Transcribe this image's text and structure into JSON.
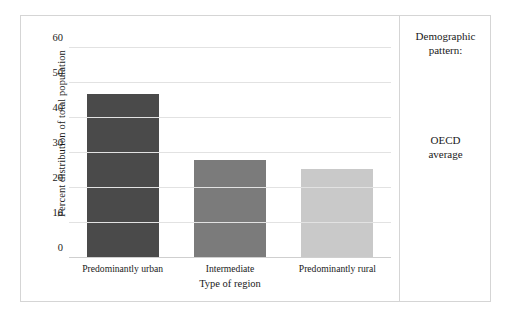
{
  "chart_data": {
    "type": "bar",
    "title": "",
    "subtitle": "",
    "categories": [
      "Predominantly urban",
      "Intermediate",
      "Predominantly rural"
    ],
    "values": [
      47,
      28,
      25.5
    ],
    "series": [
      {
        "name": "OECD average",
        "values": [
          47,
          28,
          25.5
        ],
        "colors": [
          "#4a4a4a",
          "#7b7b7b",
          "#c9c9c9"
        ]
      }
    ],
    "xlabel": "Type of region",
    "ylabel": "Percent distribution of total population",
    "ylim": [
      0,
      60
    ],
    "yticks": [
      0,
      10,
      20,
      30,
      40,
      50,
      60
    ],
    "ytick_labels": [
      "0",
      "10",
      "20",
      "30",
      "40",
      "50",
      "60"
    ],
    "grid": true,
    "grid_axis": "y",
    "legend_position": "right",
    "legend_title": "Demographic pattern:",
    "legend_entries": [
      "OECD average"
    ]
  },
  "legend": {
    "title_line1": "Demographic",
    "title_line2": "pattern:",
    "entry_line1": "OECD",
    "entry_line2": "average"
  },
  "colors": {
    "bar_urban": "#4a4a4a",
    "bar_intermediate": "#7b7b7b",
    "bar_rural": "#c9c9c9",
    "gridline": "#e2e2e2",
    "frame": "#d5d5d5",
    "background": "#ffffff",
    "text": "#1a1a1a"
  }
}
